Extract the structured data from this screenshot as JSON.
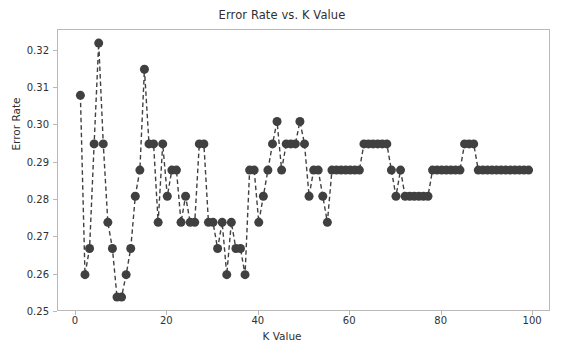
{
  "chart_data": {
    "type": "line",
    "title": "Error Rate vs. K Value",
    "xlabel": "K Value",
    "ylabel": "Error Rate",
    "xlim": [
      -3.9,
      103.9
    ],
    "ylim": [
      0.25,
      0.3255
    ],
    "xticks": [
      0,
      20,
      40,
      60,
      80,
      100
    ],
    "xticklabels": [
      "0",
      "20",
      "40",
      "60",
      "80",
      "100"
    ],
    "yticks": [
      0.25,
      0.26,
      0.27,
      0.28,
      0.29,
      0.3,
      0.31,
      0.32
    ],
    "yticklabels": [
      "0.25",
      "0.26",
      "0.27",
      "0.28",
      "0.29",
      "0.30",
      "0.31",
      "0.32"
    ],
    "grid": false,
    "legend": null,
    "marker": "o",
    "markersize": 9,
    "markerfacecolor": "#404040",
    "linestyle": "dashed",
    "linecolor": "#404040",
    "linewidth": 1.4,
    "x": [
      1,
      2,
      3,
      4,
      5,
      6,
      7,
      8,
      9,
      10,
      11,
      12,
      13,
      14,
      15,
      16,
      17,
      18,
      19,
      20,
      21,
      22,
      23,
      24,
      25,
      26,
      27,
      28,
      29,
      30,
      31,
      32,
      33,
      34,
      35,
      36,
      37,
      38,
      39,
      40,
      41,
      42,
      43,
      44,
      45,
      46,
      47,
      48,
      49,
      50,
      51,
      52,
      53,
      54,
      55,
      56,
      57,
      58,
      59,
      60,
      61,
      62,
      63,
      64,
      65,
      66,
      67,
      68,
      69,
      70,
      71,
      72,
      73,
      74,
      75,
      76,
      77,
      78,
      79,
      80,
      81,
      82,
      83,
      84,
      85,
      86,
      87,
      88,
      89,
      90,
      91,
      92,
      93,
      94,
      95,
      96,
      97,
      98,
      99
    ],
    "y": [
      0.308,
      0.26,
      0.267,
      0.295,
      0.322,
      0.295,
      0.274,
      0.267,
      0.254,
      0.254,
      0.26,
      0.267,
      0.281,
      0.288,
      0.315,
      0.295,
      0.295,
      0.274,
      0.295,
      0.281,
      0.288,
      0.288,
      0.274,
      0.281,
      0.274,
      0.274,
      0.295,
      0.295,
      0.274,
      0.274,
      0.267,
      0.274,
      0.26,
      0.274,
      0.267,
      0.267,
      0.26,
      0.288,
      0.288,
      0.274,
      0.281,
      0.288,
      0.295,
      0.301,
      0.288,
      0.295,
      0.295,
      0.295,
      0.301,
      0.295,
      0.281,
      0.288,
      0.288,
      0.281,
      0.274,
      0.288,
      0.288,
      0.288,
      0.288,
      0.288,
      0.288,
      0.288,
      0.295,
      0.295,
      0.295,
      0.295,
      0.295,
      0.295,
      0.288,
      0.281,
      0.288,
      0.281,
      0.281,
      0.281,
      0.281,
      0.281,
      0.281,
      0.288,
      0.288,
      0.288,
      0.288,
      0.288,
      0.288,
      0.288,
      0.295,
      0.295,
      0.295,
      0.288,
      0.288,
      0.288,
      0.288,
      0.288,
      0.288,
      0.288,
      0.288,
      0.288,
      0.288,
      0.288,
      0.288
    ],
    "series_name": "Error Rate"
  }
}
